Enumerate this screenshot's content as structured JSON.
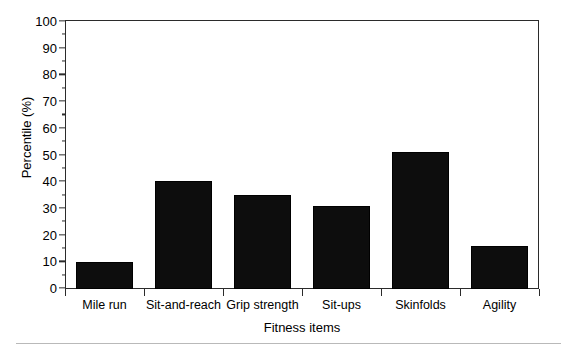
{
  "chart_data": {
    "type": "bar",
    "title": "",
    "categories": [
      "Mile run",
      "Sit-and-reach",
      "Grip strength",
      "Sit-ups",
      "Skinfolds",
      "Agility"
    ],
    "values": [
      10,
      40,
      35,
      31,
      51,
      16
    ],
    "series": [
      {
        "name": "Percentile",
        "values": [
          10,
          40,
          35,
          31,
          51,
          16
        ]
      }
    ],
    "xlabel": "Fitness items",
    "ylabel": "Percentile (%)",
    "ylim": [
      0,
      100
    ],
    "ytick_step": 10,
    "yminor_step": 5,
    "yticks": [
      0,
      10,
      20,
      30,
      40,
      50,
      60,
      70,
      80,
      90,
      100
    ],
    "ytick_labels": [
      "0",
      "10",
      "20",
      "30",
      "40",
      "50",
      "60",
      "70",
      "80",
      "90",
      "100"
    ],
    "grid": false,
    "legend": false,
    "legend_position": "none",
    "bar_color": "#0d0d0d",
    "frame_color": "#2b2b2b",
    "background": "#ffffff"
  },
  "footer": {
    "rule_color": "#b9b9b9"
  }
}
